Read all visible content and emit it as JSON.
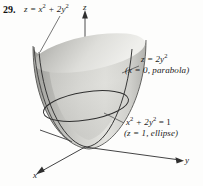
{
  "figure": {
    "problem_number": "29.",
    "surface_equation": {
      "base": "z = x",
      "exp1": "2",
      "mid": " + 2y",
      "exp2": "2"
    },
    "axes": {
      "z": "z",
      "y": "y",
      "x": "x"
    },
    "annotations": {
      "parabola": {
        "line1_base": "z = 2y",
        "line1_exp": "2",
        "line2": "(x = 0, parabola)"
      },
      "ellipse": {
        "line1_a": "x",
        "line1_exp1": "2",
        "line1_b": " + 2y",
        "line1_exp2": "2",
        "line1_c": " = 1",
        "line2": "(z = 1, ellipse)"
      }
    },
    "colors": {
      "ink": "#1b1b1b",
      "surface_light": "#e8e8e6",
      "surface_mid": "#c9c9c6",
      "surface_dark": "#9a9a97",
      "outline": "#4a4a48",
      "background": "#fdfdfc"
    }
  }
}
